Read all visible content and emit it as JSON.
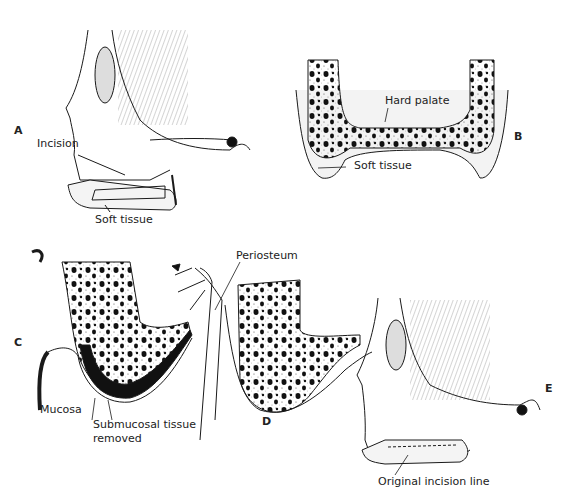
{
  "figure": {
    "panels": [
      {
        "id": "A",
        "letter": "A",
        "labels": {
          "incision": "Incision",
          "soft_tissue": "Soft tissue"
        }
      },
      {
        "id": "B",
        "letter": "B",
        "labels": {
          "hard_palate": "Hard palate",
          "soft_tissue": "Soft tissue"
        }
      },
      {
        "id": "C",
        "letter": "C",
        "labels": {
          "mucosa": "Mucosa",
          "submucosal_1": "Submucosal tissue",
          "submucosal_2": "removed"
        }
      },
      {
        "id": "D",
        "letter": "D",
        "labels": {
          "periosteum": "Periosteum"
        }
      },
      {
        "id": "E",
        "letter": "E",
        "labels": {
          "incision_line": "Original incision line"
        }
      }
    ],
    "colors": {
      "ink": "#1a1a1a",
      "paper": "#ffffff",
      "stipple": "#555555"
    }
  }
}
